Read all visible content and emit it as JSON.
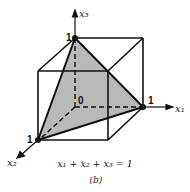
{
  "figure": {
    "axes": {
      "x1": "x₁",
      "x2": "x₂",
      "x3": "x₃"
    },
    "points": {
      "top": "1",
      "right": "1",
      "left": "1",
      "origin": "0"
    },
    "equation": "x₁ + x₂ + x₃ = 1",
    "caption": "(b)",
    "colors": {
      "plane_fill": "#b9b9b9",
      "lines": "#111111"
    }
  }
}
